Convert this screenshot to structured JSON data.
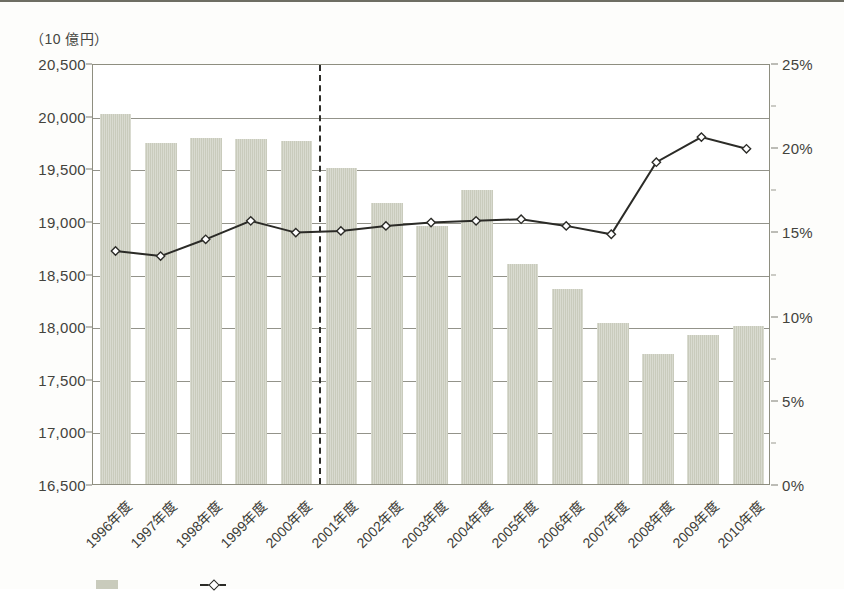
{
  "unit_caption": "（10 億円）",
  "chart_data": {
    "type": "bar",
    "title": "",
    "xlabel": "",
    "ylabel": "（10 億円）",
    "grid": true,
    "legend_position": "bottom",
    "categories": [
      "1996年度",
      "1997年度",
      "1998年度",
      "1999年度",
      "2000年度",
      "2001年度",
      "2002年度",
      "2003年度",
      "2004年度",
      "2005年度",
      "2006年度",
      "2007年度",
      "2008年度",
      "2009年度",
      "2010年度"
    ],
    "axes": {
      "left": {
        "ticks": [
          "16,500",
          "17,000",
          "17,500",
          "18,000",
          "18,500",
          "19,000",
          "19,500",
          "20,000",
          "20,500"
        ],
        "tick_values": [
          16500,
          17000,
          17500,
          18000,
          18500,
          19000,
          19500,
          20000,
          20500
        ],
        "ylim": [
          16500,
          20500
        ]
      },
      "right": {
        "ticks": [
          "0%",
          "5%",
          "10%",
          "15%",
          "20%",
          "25%"
        ],
        "tick_values": [
          0,
          5,
          10,
          15,
          20,
          25
        ],
        "ylim": [
          0,
          25
        ]
      }
    },
    "series": [
      {
        "name": "bar-series",
        "kind": "bar",
        "axis": "left",
        "color": "#c9cbbc",
        "values": [
          20020,
          19740,
          19790,
          19780,
          19760,
          19500,
          19170,
          18950,
          19290,
          18590,
          18350,
          18030,
          17740,
          17920,
          18000
        ]
      },
      {
        "name": "line-series",
        "kind": "line",
        "axis": "right",
        "color": "#2b2b27",
        "marker": "diamond",
        "values": [
          13.9,
          13.6,
          14.6,
          15.7,
          15.0,
          15.1,
          15.4,
          15.6,
          15.7,
          15.8,
          15.4,
          14.9,
          19.2,
          20.7,
          20.0
        ]
      }
    ],
    "annotations": [
      {
        "type": "vertical-dashed-line",
        "after_category": "2000年度",
        "style": "dashed"
      }
    ]
  },
  "legend": {
    "items": [
      {
        "swatch": "bar",
        "label": ""
      },
      {
        "swatch": "line",
        "label": ""
      }
    ]
  }
}
